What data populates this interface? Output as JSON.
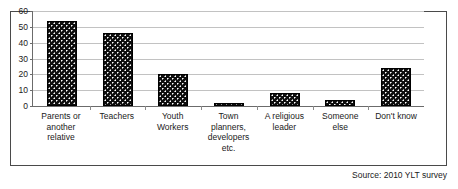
{
  "chart_data": {
    "type": "bar",
    "title": "",
    "subtitle": "",
    "xlabel": "",
    "ylabel": "",
    "ylim": [
      0,
      60
    ],
    "yticks": [
      0,
      10,
      20,
      30,
      40,
      50,
      60
    ],
    "grid": true,
    "legend": null,
    "orientation": "vertical",
    "categories": [
      "Parents or another relative",
      "Teachers",
      "Youth Workers",
      "Town planners, developers etc.",
      "A religious leader",
      "Someone else",
      "Don't know"
    ],
    "values": [
      54,
      46,
      20,
      2,
      8,
      4,
      24
    ],
    "bar_color": "#0d0d0d",
    "bar_pattern": "black fill with white dots",
    "annotations": [
      "Source: 2010 YLT survey"
    ]
  },
  "figure": {
    "source_note": "Source: 2010 YLT survey",
    "frame_color": "#4a4a4a",
    "gridline_color": "#c2c2c2",
    "axis_color": "#6b6b6b"
  }
}
